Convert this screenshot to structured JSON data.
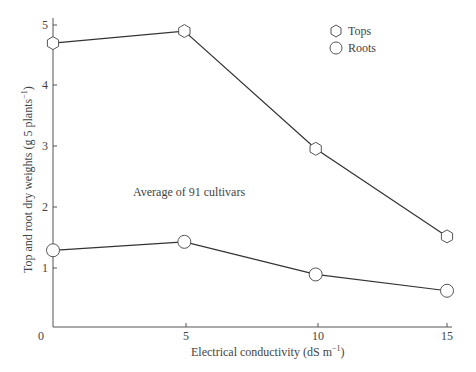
{
  "chart_data": {
    "type": "line",
    "title": "",
    "xlabel": "Electrical conductivity (dS m⁻¹)",
    "ylabel": "Top and root dry weights (g 5 plants⁻¹)",
    "xlim": [
      0,
      15
    ],
    "ylim": [
      0,
      5
    ],
    "x_ticks": [
      0,
      5,
      10,
      15
    ],
    "y_ticks": [
      0,
      1,
      2,
      3,
      4,
      5
    ],
    "x": [
      0,
      5,
      10,
      15
    ],
    "series": [
      {
        "name": "Tops",
        "marker": "hexagon",
        "values": [
          4.7,
          4.9,
          2.95,
          1.5
        ]
      },
      {
        "name": "Roots",
        "marker": "circle",
        "values": [
          1.27,
          1.41,
          0.87,
          0.6
        ]
      }
    ],
    "annotations": [
      "Average of 91 cultivars"
    ],
    "legend_position": "upper right",
    "grid": false
  },
  "labels": {
    "xlabel": "Electrical conductivity (dS m",
    "xlabel_sup": "−1",
    "xlabel_end": ")",
    "ylabel": "Top and root dry weights (g 5 plants",
    "ylabel_sup": "−1",
    "ylabel_end": ")",
    "annotation": "Average of 91 cultivars",
    "legend_tops": "Tops",
    "legend_roots": "Roots",
    "xt0": "0",
    "xt5": "5",
    "xt10": "10",
    "xt15": "15",
    "yt1": "1",
    "yt2": "2",
    "yt3": "3",
    "yt4": "4",
    "yt5": "5"
  }
}
